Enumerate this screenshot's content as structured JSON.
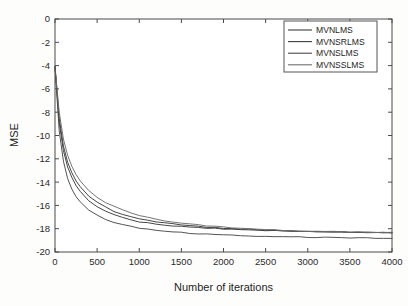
{
  "chart_data": {
    "type": "line",
    "title": "",
    "xlabel": "Number of iterations",
    "ylabel": "MSE",
    "xlim": [
      0,
      4000
    ],
    "ylim": [
      -20,
      0
    ],
    "xticks": [
      0,
      500,
      1000,
      1500,
      2000,
      2500,
      3000,
      3500,
      4000
    ],
    "xtick_labels": [
      "0",
      "500",
      "1000",
      "1500",
      "2000",
      "2500",
      "3000",
      "3500",
      "4000"
    ],
    "yticks": [
      0,
      -2,
      -4,
      -6,
      -8,
      -10,
      -12,
      -14,
      -16,
      -18,
      -20
    ],
    "ytick_labels": [
      "0",
      "-2",
      "-4",
      "-6",
      "-8",
      "-10",
      "-12",
      "-14",
      "-16",
      "-18",
      "-20"
    ],
    "grid": false,
    "legend_position": "upper right",
    "legend_entries": [
      "MVNLMS",
      "MVNSRLMS",
      "MVNSLMS",
      "MVNSSLMS"
    ],
    "x": [
      0,
      50,
      100,
      150,
      200,
      250,
      300,
      400,
      500,
      600,
      700,
      800,
      900,
      1000,
      1100,
      1200,
      1300,
      1400,
      1500,
      1600,
      1700,
      1800,
      1900,
      2000,
      2100,
      2200,
      2300,
      2400,
      2500,
      2600,
      2700,
      2800,
      2900,
      3000,
      3100,
      3200,
      3300,
      3400,
      3500,
      3600,
      3700,
      3800,
      3900,
      4000
    ],
    "series": [
      {
        "name": "MVNLMS",
        "color": "#3c3c3c",
        "values": [
          -4.1,
          -8.9,
          -11.3,
          -12.7,
          -13.6,
          -14.3,
          -14.8,
          -15.6,
          -16.1,
          -16.5,
          -16.8,
          -17.05,
          -17.25,
          -17.4,
          -17.5,
          -17.6,
          -17.68,
          -17.74,
          -17.8,
          -17.86,
          -17.9,
          -17.94,
          -17.98,
          -18.01,
          -18.05,
          -18.08,
          -18.1,
          -18.13,
          -18.15,
          -18.18,
          -18.2,
          -18.22,
          -18.23,
          -18.25,
          -18.26,
          -18.27,
          -18.28,
          -18.29,
          -18.3,
          -18.31,
          -18.32,
          -18.33,
          -18.34,
          -18.35
        ]
      },
      {
        "name": "MVNSRLMS",
        "color": "#3c3c3c",
        "values": [
          -4.1,
          -8.5,
          -10.9,
          -12.3,
          -13.2,
          -13.9,
          -14.4,
          -15.2,
          -15.75,
          -16.15,
          -16.5,
          -16.75,
          -16.98,
          -17.15,
          -17.3,
          -17.42,
          -17.52,
          -17.6,
          -17.68,
          -17.75,
          -17.81,
          -17.86,
          -17.91,
          -17.95,
          -17.99,
          -18.03,
          -18.06,
          -18.09,
          -18.12,
          -18.15,
          -18.17,
          -18.19,
          -18.21,
          -18.23,
          -18.24,
          -18.26,
          -18.27,
          -18.28,
          -18.29,
          -18.3,
          -18.31,
          -18.32,
          -18.33,
          -18.34
        ]
      },
      {
        "name": "MVNSLMS",
        "color": "#4a4a4a",
        "values": [
          -4.1,
          -9.6,
          -12.2,
          -13.7,
          -14.6,
          -15.25,
          -15.7,
          -16.4,
          -16.85,
          -17.2,
          -17.45,
          -17.65,
          -17.8,
          -17.95,
          -18.05,
          -18.15,
          -18.22,
          -18.28,
          -18.33,
          -18.38,
          -18.42,
          -18.46,
          -18.5,
          -18.53,
          -18.56,
          -18.59,
          -18.61,
          -18.63,
          -18.65,
          -18.67,
          -18.69,
          -18.7,
          -18.72,
          -18.73,
          -18.74,
          -18.75,
          -18.76,
          -18.77,
          -18.78,
          -18.79,
          -18.8,
          -18.81,
          -18.82,
          -18.83
        ]
      },
      {
        "name": "MVNSSLMS",
        "color": "#6e6e6e",
        "values": [
          -4.1,
          -8.0,
          -10.3,
          -11.7,
          -12.65,
          -13.35,
          -13.9,
          -14.72,
          -15.3,
          -15.75,
          -16.1,
          -16.4,
          -16.64,
          -16.85,
          -17.02,
          -17.17,
          -17.3,
          -17.41,
          -17.51,
          -17.6,
          -17.68,
          -17.75,
          -17.81,
          -17.87,
          -17.92,
          -17.97,
          -18.01,
          -18.05,
          -18.08,
          -18.11,
          -18.14,
          -18.17,
          -18.19,
          -18.21,
          -18.23,
          -18.25,
          -18.26,
          -18.28,
          -18.29,
          -18.3,
          -18.31,
          -18.32,
          -18.33,
          -18.34
        ]
      }
    ]
  },
  "axis": {
    "xlabel": "Number of iterations",
    "ylabel": "MSE"
  },
  "legend": {
    "items": [
      {
        "label": "MVNLMS"
      },
      {
        "label": "MVNSRLMS"
      },
      {
        "label": "MVNSLMS"
      },
      {
        "label": "MVNSSLMS"
      }
    ]
  },
  "colors": {
    "background": "#fdfdfc",
    "axis": "#4a4a4a",
    "text": "#1f1f1f"
  }
}
